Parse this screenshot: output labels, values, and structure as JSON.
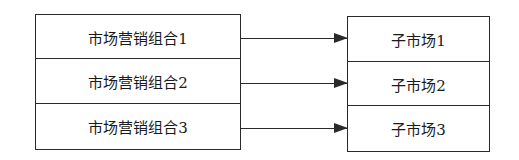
{
  "diagram": {
    "type": "mapping",
    "left_boxes": [
      {
        "label": "市场营销组合1"
      },
      {
        "label": "市场营销组合2"
      },
      {
        "label": "市场营销组合3"
      }
    ],
    "right_boxes": [
      {
        "label": "子市场1"
      },
      {
        "label": "子市场2"
      },
      {
        "label": "子市场3"
      }
    ],
    "edges": [
      {
        "from": "市场营销组合1",
        "to": "子市场1"
      },
      {
        "from": "市场营销组合2",
        "to": "子市场2"
      },
      {
        "from": "市场营销组合3",
        "to": "子市场3"
      }
    ],
    "colors": {
      "line": "#2a2a2a",
      "background": "#ffffff"
    }
  }
}
